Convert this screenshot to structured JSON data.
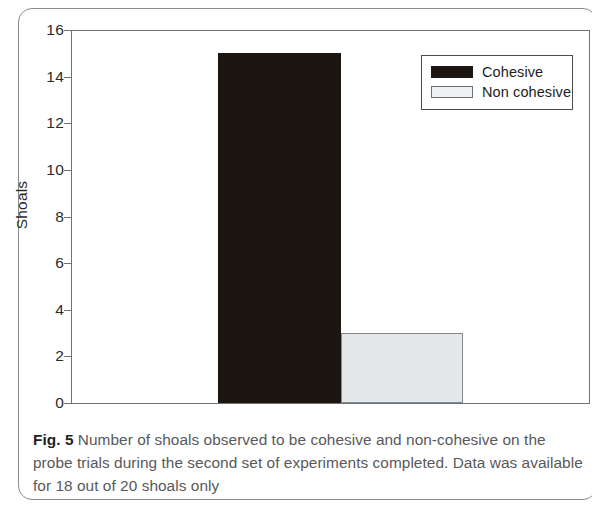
{
  "figure": {
    "caption_fignum": "Fig. 5",
    "caption_text": " Number of shoals observed to be cohesive and non-cohesive on the probe trials during the second set of experiments completed. Data was available for 18 out of 20 shoals only"
  },
  "legend": {
    "position": "top-right",
    "items": [
      {
        "label": "Cohesive",
        "color": "#1c1512"
      },
      {
        "label": "Non cohesive",
        "color": "#eef1f3"
      }
    ]
  },
  "axes": {
    "ylabel": "Shoals",
    "yticks": [
      "0",
      "2",
      "4",
      "6",
      "8",
      "10",
      "12",
      "14",
      "16"
    ],
    "xticks": []
  },
  "chart_data": {
    "type": "bar",
    "title": "",
    "subtitle": "",
    "xlabel": "",
    "ylabel": "Shoals",
    "categories": [
      "Cohesive",
      "Non cohesive"
    ],
    "values": [
      15,
      3
    ],
    "series": [
      {
        "name": "Shoals",
        "values": [
          15,
          3
        ]
      }
    ],
    "ylim": [
      0,
      16
    ],
    "ytick_values": [
      0,
      2,
      4,
      6,
      8,
      10,
      12,
      14,
      16
    ],
    "xtick_labels": [],
    "grid": false,
    "legend_position": "top-right",
    "bar_colors": [
      "#1c1512",
      "#e4e8eb"
    ],
    "annotations": [],
    "notes": "Data was available for 18 out of 20 shoals only"
  }
}
